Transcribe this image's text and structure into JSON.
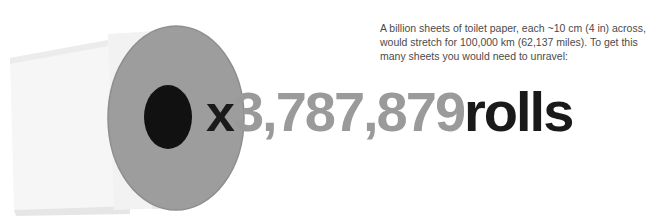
{
  "caption": {
    "text": "A billion sheets of toilet paper, each ~10 cm (4 in) across, would stretch for 100,000 km (62,137 miles). To get this many sheets you would need to unravel:"
  },
  "multiplier": {
    "prefix": "x",
    "number": "3,787,879",
    "unit": "rolls"
  },
  "illustration": {
    "name": "toilet-paper-roll",
    "colors": {
      "paper_light": "#f4f4f4",
      "paper_shadow": "#e2e2e2",
      "roll_face": "#9d9d9d",
      "roll_face_dark": "#8f8f8f",
      "core_hole": "#111111",
      "edge_line": "#d6d6d6"
    }
  },
  "palette": {
    "background": "#ffffff",
    "text_dark": "#1a1a1a",
    "text_gray": "#9a9a9a",
    "caption_gray": "#4b4b4b"
  }
}
